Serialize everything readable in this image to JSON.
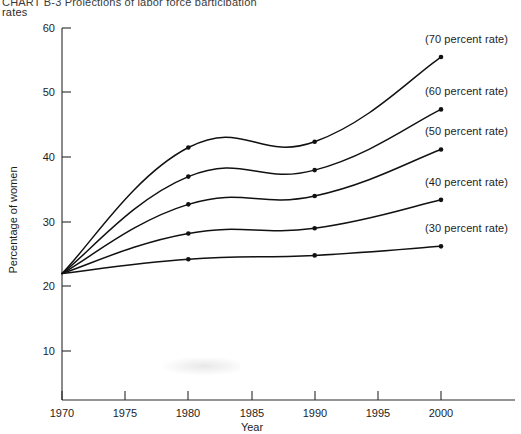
{
  "title": {
    "line1": "CHART B-3  Projections of labor force participation",
    "line2": "rates"
  },
  "axes": {
    "y_title": "Percentage of women",
    "x_title": "Year",
    "y_ticks": [
      "60",
      "50",
      "40",
      "30",
      "20",
      "10"
    ],
    "x_ticks": [
      "1970",
      "1975",
      "1980",
      "1985",
      "1990",
      "1995",
      "2000"
    ]
  },
  "chart_data": {
    "type": "line",
    "title": "CHART B-3  Projections of labor force participation rates",
    "xlabel": "Year",
    "ylabel": "Percentage of women",
    "xlim": [
      1970,
      2000
    ],
    "ylim": [
      0,
      60
    ],
    "grid": false,
    "legend_position": "right-inline-annotations",
    "x": [
      1970,
      1980,
      1990,
      2000
    ],
    "series": [
      {
        "name": "(70 percent rate)",
        "label": "(70 percent rate)",
        "values": [
          22.0,
          41.5,
          42.4,
          55.5
        ]
      },
      {
        "name": "(60 percent rate)",
        "label": "(60 percent rate)",
        "values": [
          22.0,
          37.0,
          38.0,
          47.4
        ]
      },
      {
        "name": "(50 percent rate)",
        "label": "(50 percent rate)",
        "values": [
          22.0,
          32.7,
          34.0,
          41.2
        ]
      },
      {
        "name": "(40 percent rate)",
        "label": "(40 percent rate)",
        "values": [
          22.0,
          28.2,
          29.0,
          33.4
        ]
      },
      {
        "name": "(30 percent rate)",
        "label": "(30 percent rate)",
        "values": [
          22.0,
          24.2,
          24.8,
          26.2
        ]
      }
    ]
  }
}
